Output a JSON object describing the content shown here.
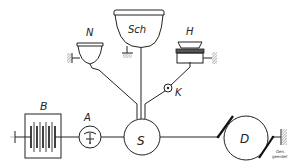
{
  "diagram": {
    "type": "circuit schematic",
    "components": {
      "battery": {
        "label": "B"
      },
      "ammeter": {
        "label": "A"
      },
      "junction": {
        "label": "S"
      },
      "bowl_left": {
        "label": "N"
      },
      "bowl_center": {
        "label": "Sch"
      },
      "receiver_right": {
        "label": "H"
      },
      "contact": {
        "label": "K"
      },
      "drum": {
        "label": "D"
      }
    },
    "ground_note": {
      "line1": "Gen.",
      "line2": "geerdet"
    }
  }
}
